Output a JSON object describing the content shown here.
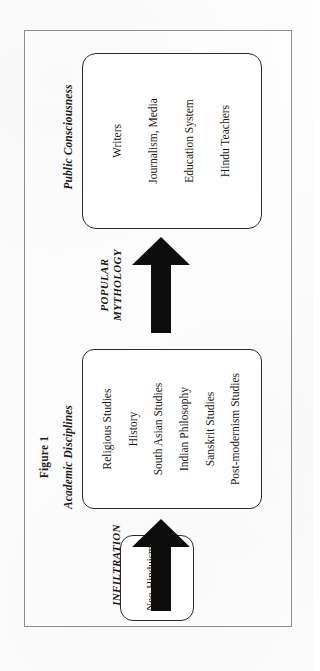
{
  "figure": {
    "title": "Figure 1"
  },
  "groups": {
    "academic_caption": "Academic Disciplines",
    "public_caption": "Public Consciousness"
  },
  "source_box": {
    "line1": "Neo-Hinduism",
    "line2": "Thesis"
  },
  "academic_box": {
    "items": [
      "Religious Studies",
      "History",
      "South Asian Studies",
      "Indian Philosophy",
      "Sanskrit Studies",
      "Post-modernism Studies"
    ]
  },
  "public_box": {
    "items": [
      "Writers",
      "Journalism, Media",
      "Education System",
      "Hindu Teachers"
    ]
  },
  "arrows": {
    "infiltration": {
      "label": "INFILTRATION"
    },
    "mythology": {
      "label_line1": "POPULAR",
      "label_line2": "MYTHOLOGY"
    }
  },
  "colors": {
    "frame": "#8f8f93",
    "box_border": "#2a2a2a",
    "arrow_fill": "#0d0d0d",
    "text": "#171717",
    "background": "#ffffff"
  }
}
